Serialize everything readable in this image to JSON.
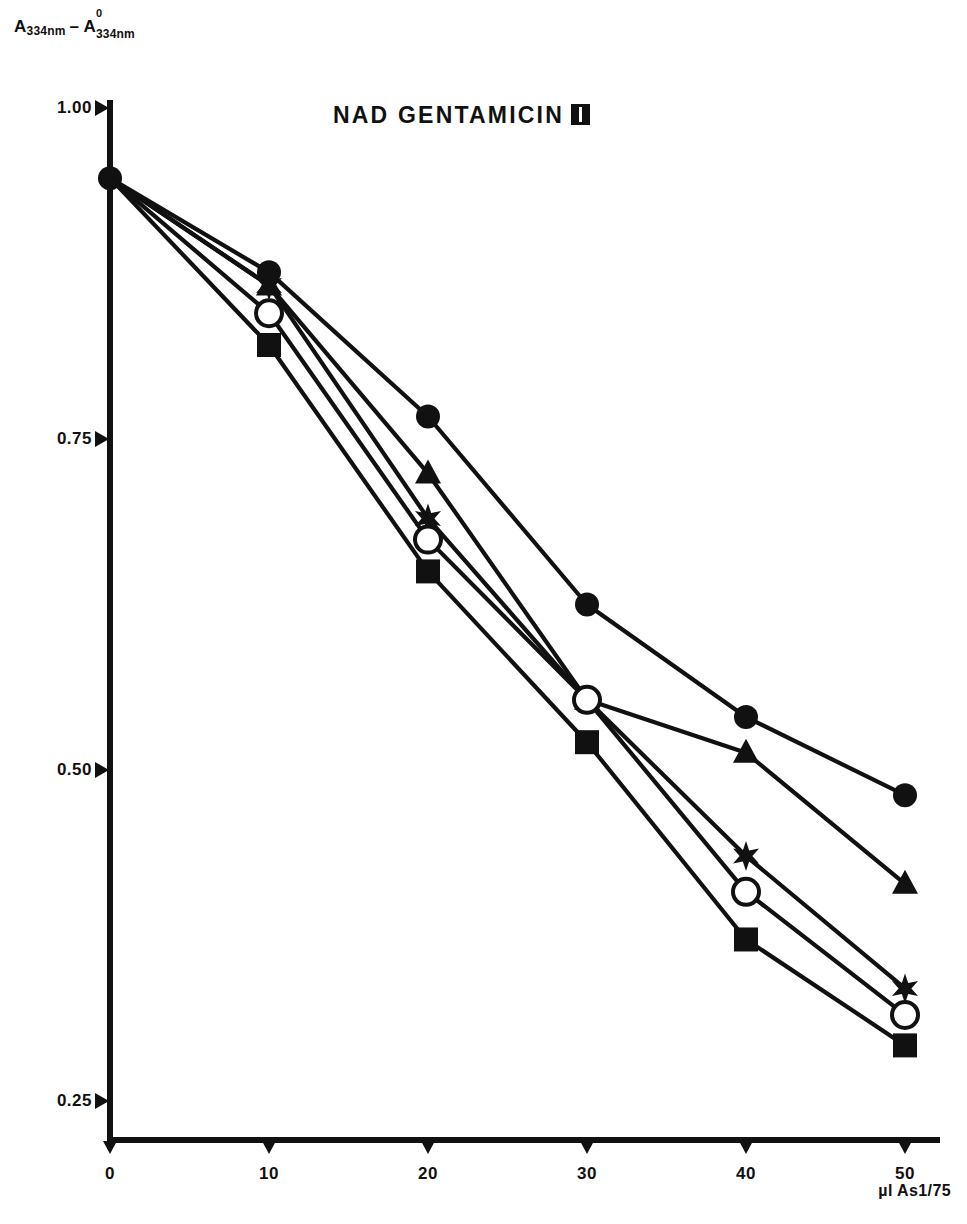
{
  "chart_data": {
    "type": "line",
    "title": "NAD  GENTAMICIN",
    "title_suffix_symbol": "roman-numeral-two",
    "ylabel": "A 334nm - A⁰ 334nm",
    "ylabel_parts": {
      "a1": "A",
      "sub1": "334nm",
      "minus": "–",
      "a2": "A",
      "sup2": "0",
      "sub2": "334nm"
    },
    "xlabel": "µl As1/75",
    "x": [
      0,
      10,
      20,
      30,
      40,
      50
    ],
    "xticks": [
      "0",
      "10",
      "20",
      "30",
      "40",
      "50"
    ],
    "yticks": [
      "1.00",
      "0.75",
      "0.50",
      "0.25"
    ],
    "ytick_values": [
      1.0,
      0.75,
      0.5,
      0.25
    ],
    "xlim": [
      -2,
      52
    ],
    "ylim": [
      0.235,
      1.015
    ],
    "grid": false,
    "legend": "none",
    "series": [
      {
        "name": "series-filled-circle",
        "marker": "filled-circle",
        "values": [
          0.947,
          0.876,
          0.767,
          0.625,
          0.54,
          0.481
        ]
      },
      {
        "name": "series-filled-triangle",
        "marker": "filled-triangle",
        "values": [
          0.947,
          0.866,
          0.724,
          0.553,
          0.513,
          0.414
        ]
      },
      {
        "name": "series-filled-star",
        "marker": "filled-star",
        "values": [
          0.947,
          0.866,
          0.69,
          0.553,
          0.435,
          0.335
        ]
      },
      {
        "name": "series-open-circle",
        "marker": "open-circle",
        "values": [
          0.947,
          0.845,
          0.674,
          0.553,
          0.408,
          0.315
        ]
      },
      {
        "name": "series-filled-square",
        "marker": "filled-square",
        "values": [
          0.947,
          0.821,
          0.65,
          0.521,
          0.372,
          0.292
        ]
      }
    ],
    "colors": {
      "ink": "#111111",
      "background": "#ffffff"
    }
  }
}
